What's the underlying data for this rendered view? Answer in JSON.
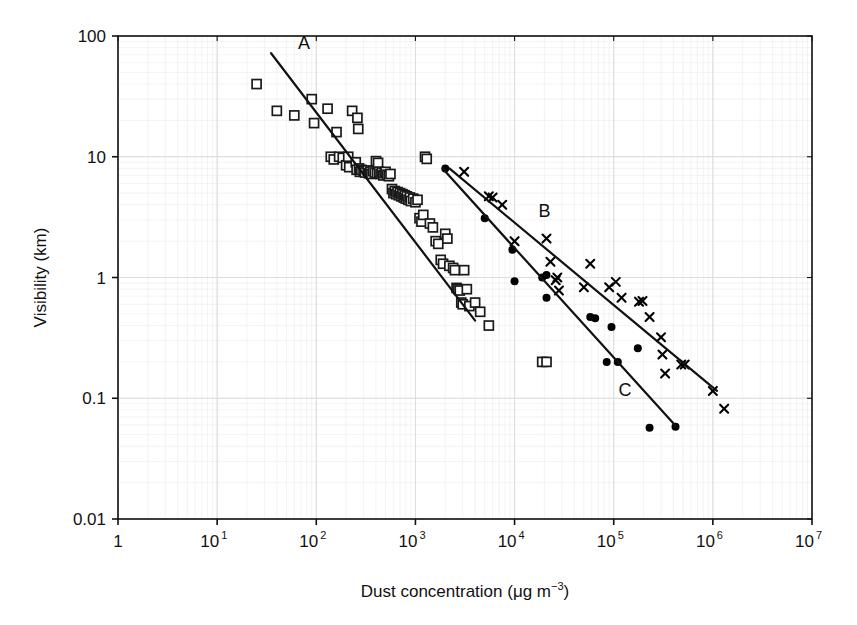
{
  "chart_data": {
    "type": "scatter",
    "title": "",
    "xlabel": "Dust concentration (μg m−3)",
    "xlabel_parts": {
      "text": "Dust concentration (",
      "mu": "μ",
      "unit": "g m",
      "exp": "−3",
      "close": ")"
    },
    "ylabel": "Visibility (km)",
    "xscale": "log",
    "yscale": "log",
    "xlim": [
      1,
      10000000
    ],
    "ylim": [
      0.01,
      100
    ],
    "grid": "minor-log-grid-faint",
    "legend_position": "inline-line-labels",
    "xticks": [
      {
        "value": 1,
        "label": "1",
        "exp": ""
      },
      {
        "value": 10,
        "label": "10",
        "exp": "1"
      },
      {
        "value": 100,
        "label": "10",
        "exp": "2"
      },
      {
        "value": 1000,
        "label": "10",
        "exp": "3"
      },
      {
        "value": 10000,
        "label": "10",
        "exp": "4"
      },
      {
        "value": 100000,
        "label": "10",
        "exp": "5"
      },
      {
        "value": 1000000,
        "label": "10",
        "exp": "6"
      },
      {
        "value": 10000000,
        "label": "10",
        "exp": "7"
      }
    ],
    "yticks": [
      {
        "value": 100,
        "label": "100"
      },
      {
        "value": 10,
        "label": "10"
      },
      {
        "value": 1,
        "label": "1"
      },
      {
        "value": 0.1,
        "label": "0.1"
      },
      {
        "value": 0.01,
        "label": "0.01"
      }
    ],
    "series": [
      {
        "name": "open-squares",
        "marker": "open-square",
        "marker_size": 9,
        "points": [
          [
            25,
            40
          ],
          [
            40,
            24
          ],
          [
            60,
            22
          ],
          [
            90,
            30
          ],
          [
            95,
            19
          ],
          [
            130,
            25
          ],
          [
            140,
            10
          ],
          [
            150,
            9.5
          ],
          [
            160,
            16
          ],
          [
            170,
            10
          ],
          [
            185,
            9.8
          ],
          [
            200,
            8.5
          ],
          [
            210,
            10
          ],
          [
            215,
            8.2
          ],
          [
            230,
            24
          ],
          [
            250,
            9.0
          ],
          [
            255,
            7.8
          ],
          [
            260,
            21
          ],
          [
            265,
            17
          ],
          [
            270,
            8.0
          ],
          [
            275,
            7.5
          ],
          [
            285,
            7.8
          ],
          [
            300,
            7.6
          ],
          [
            310,
            7.4
          ],
          [
            330,
            7.7
          ],
          [
            340,
            7.3
          ],
          [
            350,
            7.5
          ],
          [
            360,
            7.2
          ],
          [
            375,
            7.6
          ],
          [
            390,
            7.4
          ],
          [
            400,
            9.2
          ],
          [
            410,
            7.3
          ],
          [
            420,
            8.9
          ],
          [
            430,
            7.5
          ],
          [
            445,
            7.2
          ],
          [
            460,
            7.4
          ],
          [
            475,
            7.0
          ],
          [
            490,
            7.3
          ],
          [
            500,
            7.5
          ],
          [
            520,
            7.1
          ],
          [
            540,
            6.9
          ],
          [
            560,
            7.2
          ],
          [
            580,
            5.4
          ],
          [
            600,
            5.0
          ],
          [
            620,
            5.2
          ],
          [
            640,
            4.9
          ],
          [
            660,
            5.1
          ],
          [
            680,
            4.8
          ],
          [
            700,
            5.0
          ],
          [
            720,
            4.7
          ],
          [
            740,
            4.9
          ],
          [
            760,
            4.6
          ],
          [
            780,
            4.8
          ],
          [
            800,
            4.5
          ],
          [
            820,
            4.7
          ],
          [
            850,
            4.4
          ],
          [
            880,
            4.6
          ],
          [
            900,
            4.3
          ],
          [
            950,
            4.5
          ],
          [
            1000,
            4.2
          ],
          [
            1050,
            4.4
          ],
          [
            1100,
            3.1
          ],
          [
            1150,
            2.9
          ],
          [
            1200,
            3.3
          ],
          [
            1250,
            10
          ],
          [
            1300,
            9.6
          ],
          [
            1400,
            2.8
          ],
          [
            1500,
            2.6
          ],
          [
            1600,
            2.0
          ],
          [
            1700,
            1.9
          ],
          [
            1800,
            1.4
          ],
          [
            1900,
            1.3
          ],
          [
            2000,
            2.3
          ],
          [
            2100,
            2.1
          ],
          [
            2200,
            1.25
          ],
          [
            2400,
            1.2
          ],
          [
            2500,
            1.15
          ],
          [
            2600,
            0.82
          ],
          [
            2700,
            0.8
          ],
          [
            2800,
            0.78
          ],
          [
            2900,
            0.62
          ],
          [
            3000,
            0.6
          ],
          [
            3100,
            1.15
          ],
          [
            3300,
            0.8
          ],
          [
            3500,
            0.58
          ],
          [
            4000,
            0.62
          ],
          [
            4500,
            0.52
          ],
          [
            5500,
            0.4
          ],
          [
            19000,
            0.2
          ],
          [
            21000,
            0.2
          ]
        ]
      },
      {
        "name": "filled-circles",
        "marker": "filled-circle",
        "marker_size": 8,
        "points": [
          [
            2000,
            8.0
          ],
          [
            5000,
            3.1
          ],
          [
            9500,
            1.7
          ],
          [
            10000,
            0.93
          ],
          [
            19000,
            1.0
          ],
          [
            21000,
            1.05
          ],
          [
            21000,
            0.68
          ],
          [
            58000,
            0.47
          ],
          [
            65000,
            0.46
          ],
          [
            95000,
            0.39
          ],
          [
            85000,
            0.2
          ],
          [
            110000,
            0.2
          ],
          [
            175000,
            0.26
          ],
          [
            230000,
            0.057
          ],
          [
            420000,
            0.058
          ]
        ]
      },
      {
        "name": "crosses",
        "marker": "cross",
        "marker_size": 8,
        "points": [
          [
            3100,
            7.5
          ],
          [
            5500,
            4.7
          ],
          [
            6000,
            4.6
          ],
          [
            7500,
            4.0
          ],
          [
            10000,
            2.0
          ],
          [
            21000,
            2.1
          ],
          [
            23000,
            1.35
          ],
          [
            26000,
            0.95
          ],
          [
            27000,
            1.0
          ],
          [
            28000,
            0.78
          ],
          [
            50000,
            0.83
          ],
          [
            58000,
            1.3
          ],
          [
            90000,
            0.83
          ],
          [
            105000,
            0.92
          ],
          [
            120000,
            0.68
          ],
          [
            180000,
            0.63
          ],
          [
            195000,
            0.64
          ],
          [
            230000,
            0.47
          ],
          [
            300000,
            0.32
          ],
          [
            310000,
            0.23
          ],
          [
            330000,
            0.16
          ],
          [
            480000,
            0.19
          ],
          [
            520000,
            0.19
          ],
          [
            1000000,
            0.115
          ],
          [
            1300000,
            0.082
          ]
        ]
      }
    ],
    "fit_lines": [
      {
        "label": "A",
        "x1": 35,
        "y1": 72,
        "x2": 4000,
        "y2": 0.44,
        "label_x": 75,
        "label_y": 78
      },
      {
        "label": "B",
        "x1": 2200,
        "y1": 8.0,
        "x2": 1100000,
        "y2": 0.115,
        "label_x": 20000,
        "label_y": 3.2
      },
      {
        "label": "C",
        "x1": 1900,
        "y1": 7.9,
        "x2": 430000,
        "y2": 0.058,
        "label_x": 130000,
        "label_y": 0.105
      }
    ],
    "annotations": [
      {
        "text": "A",
        "meaning": "regression-line-A"
      },
      {
        "text": "B",
        "meaning": "regression-line-B"
      },
      {
        "text": "C",
        "meaning": "regression-line-C"
      }
    ],
    "colors": {
      "axis": "#111111",
      "marker_stroke": "#1a1a1a",
      "marker_fill": "#000000",
      "grid_minor": "#e9e9e9",
      "grid_major": "#dddddd",
      "background": "#ffffff"
    }
  }
}
